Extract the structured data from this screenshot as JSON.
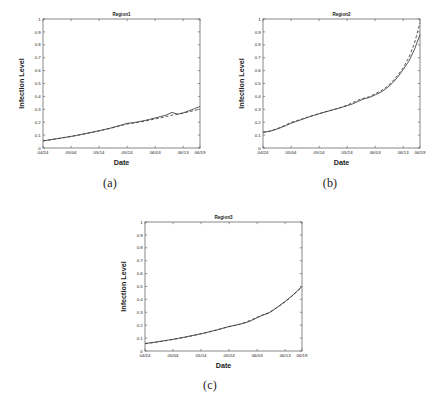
{
  "figure": {
    "panels": [
      {
        "id": "a",
        "caption": "(a)",
        "title": "Region1",
        "xlabel": "Date",
        "ylabel": "Infection Level"
      },
      {
        "id": "b",
        "caption": "(b)",
        "title": "Region2",
        "xlabel": "Date",
        "ylabel": "Infection Level"
      },
      {
        "id": "c",
        "caption": "(c)",
        "title": "Region3",
        "xlabel": "Date",
        "ylabel": "Infection Level"
      }
    ]
  },
  "chart_data": [
    {
      "type": "line",
      "title": "Region1",
      "xlabel": "Date",
      "ylabel": "Infection Level",
      "xtick_labels": [
        "04/24",
        "05/04",
        "05/14",
        "05/24",
        "06/03",
        "06/13",
        "06/19"
      ],
      "xtick_positions": [
        0,
        10,
        20,
        30,
        40,
        50,
        56
      ],
      "ytick_labels": [
        "0",
        "0.1",
        "0.2",
        "0.3",
        "0.4",
        "0.5",
        "0.6",
        "0.7",
        "0.8",
        "0.9",
        "1"
      ],
      "ylim": [
        0,
        1
      ],
      "xlim": [
        0,
        56
      ],
      "grid": false,
      "legend": "none",
      "series": [
        {
          "name": "observed",
          "style": "solid",
          "x": [
            0,
            2,
            4,
            6,
            8,
            10,
            12,
            14,
            16,
            18,
            20,
            22,
            24,
            26,
            28,
            30,
            32,
            34,
            36,
            38,
            40,
            42,
            44,
            46,
            48,
            50,
            52,
            54,
            56
          ],
          "values": [
            0.055,
            0.062,
            0.069,
            0.076,
            0.083,
            0.09,
            0.098,
            0.107,
            0.116,
            0.125,
            0.134,
            0.144,
            0.154,
            0.166,
            0.178,
            0.191,
            0.196,
            0.203,
            0.212,
            0.222,
            0.233,
            0.244,
            0.256,
            0.276,
            0.262,
            0.272,
            0.288,
            0.305,
            0.322
          ]
        },
        {
          "name": "predicted",
          "style": "dashed",
          "x": [
            0,
            2,
            4,
            6,
            8,
            10,
            12,
            14,
            16,
            18,
            20,
            22,
            24,
            26,
            28,
            30,
            32,
            34,
            36,
            38,
            40,
            42,
            44,
            46,
            48,
            50,
            52,
            54,
            56
          ],
          "values": [
            0.055,
            0.061,
            0.068,
            0.075,
            0.082,
            0.089,
            0.097,
            0.105,
            0.114,
            0.123,
            0.132,
            0.142,
            0.152,
            0.163,
            0.175,
            0.186,
            0.192,
            0.199,
            0.207,
            0.216,
            0.225,
            0.234,
            0.244,
            0.254,
            0.262,
            0.271,
            0.281,
            0.291,
            0.302
          ]
        }
      ]
    },
    {
      "type": "line",
      "title": "Region2",
      "xlabel": "Date",
      "ylabel": "Infection Level",
      "xtick_labels": [
        "04/24",
        "05/04",
        "05/14",
        "05/24",
        "06/03",
        "06/13",
        "06/19"
      ],
      "xtick_positions": [
        0,
        10,
        20,
        30,
        40,
        50,
        56
      ],
      "ytick_labels": [
        "0",
        "0.1",
        "0.2",
        "0.3",
        "0.4",
        "0.5",
        "0.6",
        "0.7",
        "0.8",
        "0.9",
        "1"
      ],
      "ylim": [
        0,
        1
      ],
      "xlim": [
        0,
        56
      ],
      "grid": false,
      "legend": "none",
      "series": [
        {
          "name": "observed",
          "style": "solid",
          "x": [
            0,
            2,
            4,
            6,
            8,
            10,
            12,
            14,
            16,
            18,
            20,
            22,
            24,
            26,
            28,
            30,
            32,
            34,
            36,
            38,
            40,
            42,
            44,
            46,
            48,
            50,
            52,
            54,
            56
          ],
          "values": [
            0.122,
            0.128,
            0.14,
            0.155,
            0.172,
            0.192,
            0.207,
            0.222,
            0.238,
            0.252,
            0.265,
            0.278,
            0.29,
            0.302,
            0.315,
            0.328,
            0.342,
            0.362,
            0.381,
            0.392,
            0.412,
            0.432,
            0.462,
            0.5,
            0.548,
            0.608,
            0.672,
            0.762,
            0.88
          ]
        },
        {
          "name": "predicted",
          "style": "dashed",
          "x": [
            0,
            2,
            4,
            6,
            8,
            10,
            12,
            14,
            16,
            18,
            20,
            22,
            24,
            26,
            28,
            30,
            32,
            34,
            36,
            38,
            40,
            42,
            44,
            46,
            48,
            50,
            52,
            54,
            56
          ],
          "values": [
            0.122,
            0.129,
            0.142,
            0.158,
            0.178,
            0.198,
            0.212,
            0.226,
            0.24,
            0.254,
            0.266,
            0.279,
            0.291,
            0.303,
            0.316,
            0.332,
            0.352,
            0.372,
            0.386,
            0.398,
            0.42,
            0.442,
            0.472,
            0.512,
            0.562,
            0.622,
            0.7,
            0.81,
            0.972
          ]
        }
      ]
    },
    {
      "type": "line",
      "title": "Region3",
      "xlabel": "Date",
      "ylabel": "Infection Level",
      "xtick_labels": [
        "04/24",
        "05/04",
        "05/14",
        "05/24",
        "06/03",
        "06/13",
        "06/19"
      ],
      "xtick_positions": [
        0,
        10,
        20,
        30,
        40,
        50,
        56
      ],
      "ytick_labels": [
        "0",
        "0.1",
        "0.2",
        "0.3",
        "0.4",
        "0.5",
        "0.6",
        "0.7",
        "0.8",
        "0.9",
        "1"
      ],
      "ylim": [
        0,
        1
      ],
      "xlim": [
        0,
        56
      ],
      "grid": false,
      "legend": "none",
      "series": [
        {
          "name": "observed",
          "style": "solid",
          "x": [
            0,
            2,
            4,
            6,
            8,
            10,
            12,
            14,
            16,
            18,
            20,
            22,
            24,
            26,
            28,
            30,
            32,
            34,
            36,
            38,
            40,
            42,
            44,
            46,
            48,
            50,
            52,
            54,
            56
          ],
          "values": [
            0.058,
            0.064,
            0.07,
            0.077,
            0.084,
            0.091,
            0.099,
            0.107,
            0.116,
            0.125,
            0.134,
            0.144,
            0.155,
            0.166,
            0.178,
            0.19,
            0.199,
            0.208,
            0.22,
            0.236,
            0.258,
            0.278,
            0.292,
            0.32,
            0.352,
            0.385,
            0.42,
            0.458,
            0.502
          ]
        },
        {
          "name": "predicted",
          "style": "dashed",
          "x": [
            0,
            2,
            4,
            6,
            8,
            10,
            12,
            14,
            16,
            18,
            20,
            22,
            24,
            26,
            28,
            30,
            32,
            34,
            36,
            38,
            40,
            42,
            44,
            46,
            48,
            50,
            52,
            54,
            56
          ],
          "values": [
            0.056,
            0.062,
            0.068,
            0.075,
            0.082,
            0.089,
            0.097,
            0.105,
            0.114,
            0.123,
            0.133,
            0.143,
            0.154,
            0.165,
            0.177,
            0.189,
            0.198,
            0.209,
            0.224,
            0.242,
            0.262,
            0.28,
            0.296,
            0.322,
            0.35,
            0.382,
            0.418,
            0.456,
            0.498
          ]
        }
      ]
    }
  ]
}
